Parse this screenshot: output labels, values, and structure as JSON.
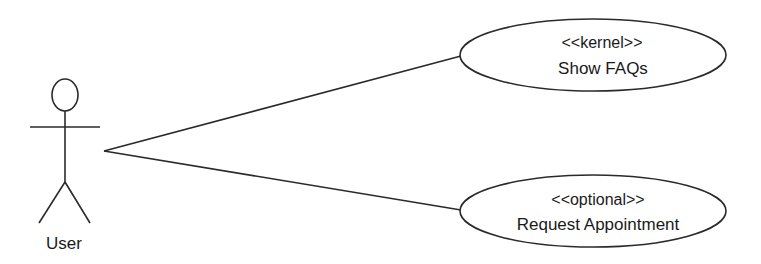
{
  "diagram": {
    "type": "use-case",
    "stroke_color": "#2a2a2a",
    "actor": {
      "label": "User"
    },
    "use_cases": [
      {
        "stereotype": "<<kernel>>",
        "name": "Show FAQs"
      },
      {
        "stereotype": "<<optional>>",
        "name": "Request Appointment"
      }
    ],
    "associations": [
      {
        "from": "User",
        "to": "Show FAQs"
      },
      {
        "from": "User",
        "to": "Request Appointment"
      }
    ]
  }
}
